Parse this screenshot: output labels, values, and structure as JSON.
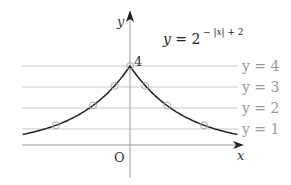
{
  "chart_data": {
    "type": "line",
    "equation_label": {
      "base": "y = 2",
      "exponent": "− |x| + 2"
    },
    "xlabel": "x",
    "ylabel": "y",
    "origin_label": "O",
    "peak_label": "4",
    "function": "2^(-|x|+2)",
    "xlim": [
      -2.9,
      2.9
    ],
    "ylim": [
      -0.9,
      4.9
    ],
    "grid": false,
    "reference_lines": [
      {
        "label": "y = 4",
        "y": 4
      },
      {
        "label": "y = 3",
        "y": 3
      },
      {
        "label": "y = 2",
        "y": 2
      },
      {
        "label": "y = 1",
        "y": 1
      }
    ],
    "marked_points": [
      {
        "x": -2,
        "y": 1
      },
      {
        "x": -1,
        "y": 2
      },
      {
        "x": -0.415,
        "y": 3
      },
      {
        "x": 0,
        "y": 4
      },
      {
        "x": 0.415,
        "y": 3
      },
      {
        "x": 1,
        "y": 2
      },
      {
        "x": 2,
        "y": 1
      }
    ],
    "colors": {
      "curve": "#222222",
      "axis": "#999999",
      "reference": "#bbbbbb",
      "label": "#999999",
      "text": "#222222"
    }
  }
}
